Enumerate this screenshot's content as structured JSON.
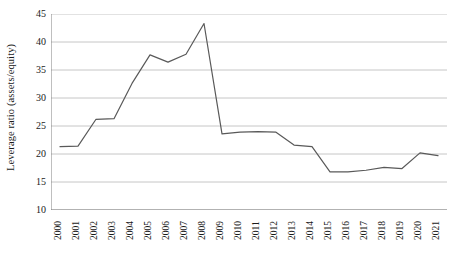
{
  "chart_data": {
    "type": "line",
    "title": "",
    "xlabel": "",
    "ylabel": "Leverage ratio (assets/equity)",
    "categories": [
      "2000",
      "2001",
      "2002",
      "2003",
      "2004",
      "2005",
      "2006",
      "2007",
      "2008",
      "2009",
      "2010",
      "2011",
      "2012",
      "2013",
      "2014",
      "2015",
      "2016",
      "2017",
      "2018",
      "2019",
      "2020",
      "2021"
    ],
    "values": [
      21.3,
      21.4,
      26.2,
      26.3,
      32.6,
      37.7,
      36.4,
      37.8,
      43.3,
      23.6,
      23.9,
      24.0,
      23.9,
      21.6,
      21.3,
      16.8,
      16.8,
      17.1,
      17.6,
      17.4,
      20.2,
      19.7
    ],
    "ylim": [
      10,
      45
    ],
    "yticks": [
      10,
      15,
      20,
      25,
      30,
      35,
      40,
      45
    ],
    "ytick_labels": [
      "10",
      "15",
      "20",
      "25",
      "30",
      "35",
      "40",
      "45"
    ],
    "grid": "horizontal",
    "legend": "none",
    "series": [
      {
        "name": "Leverage ratio",
        "color": "#595959",
        "values": [
          21.3,
          21.4,
          26.2,
          26.3,
          32.6,
          37.7,
          36.4,
          37.8,
          43.3,
          23.6,
          23.9,
          24.0,
          23.9,
          21.6,
          21.3,
          16.8,
          16.8,
          17.1,
          17.6,
          17.4,
          20.2,
          19.7
        ]
      }
    ],
    "colors": {
      "line": "#595959",
      "grid": "#bfbfbf",
      "axis": "#808080",
      "text": "#1a1a1a",
      "background": "#ffffff"
    }
  }
}
